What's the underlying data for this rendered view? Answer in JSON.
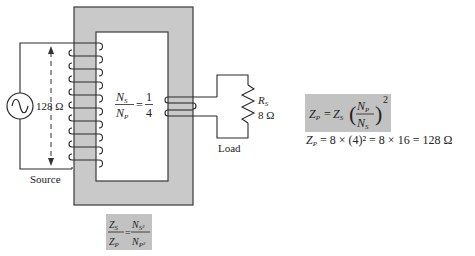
{
  "diagram": {
    "source_label": "Source",
    "primary_impedance": "128 Ω",
    "turns_ratio": {
      "num_letter": "N",
      "num_sub": "S",
      "den_letter": "N",
      "den_sub": "P",
      "equals": "=",
      "value_num": "1",
      "value_den": "4"
    },
    "load_label": "Load",
    "load_resistor": {
      "name": "R",
      "sub": "S",
      "value": "8 Ω"
    },
    "primary_turns": 10,
    "secondary_turns": 2
  },
  "formulas": {
    "impedance_ratio": {
      "lhs_num": "Z",
      "lhs_num_sub": "S",
      "lhs_den": "Z",
      "lhs_den_sub": "P",
      "equals": "=",
      "rhs_num": "N",
      "rhs_num_sub": "S²",
      "rhs_den": "N",
      "rhs_den_sub": "P²"
    },
    "primary_impedance_formula": {
      "lhs": "Z",
      "lhs_sub": "P",
      "equals": "=",
      "rhs": "Z",
      "rhs_sub": "S",
      "open_paren": "(",
      "close_paren": ")",
      "frac_num": "N",
      "frac_num_sub": "P",
      "frac_den": "N",
      "frac_den_sub": "S",
      "exponent": "2"
    },
    "calculation": "= 8 × (4)² = 8 × 16 = 128 Ω",
    "calculation_lhs": "Z",
    "calculation_lhs_sub": "P"
  },
  "colors": {
    "core_fill": "#c9c9c9",
    "box_fill": "#c2c2c2",
    "stroke": "#3a3a3a"
  }
}
